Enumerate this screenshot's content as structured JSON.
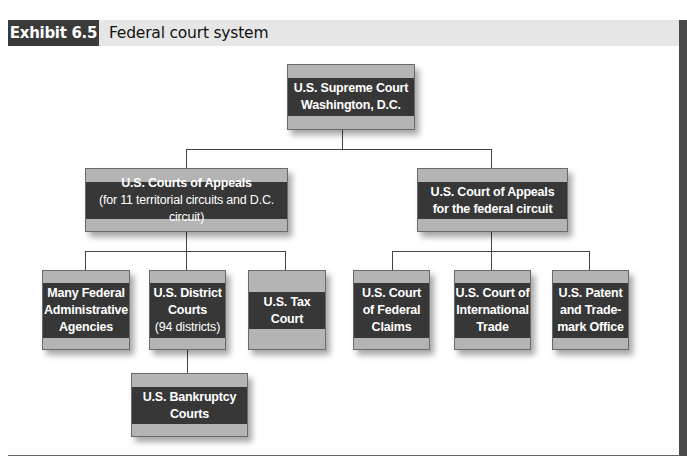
{
  "header": {
    "exhibit_label": "Exhibit 6.5",
    "title": "Federal court system"
  },
  "colors": {
    "box_band": "#b4b4b4",
    "box_dark": "#373737",
    "header_band": "#e6e6e6",
    "header_label": "#3a3a3a"
  },
  "nodes": {
    "supreme": {
      "line1": "U.S. Supreme Court",
      "line2": "Washington, D.C."
    },
    "appeals_circuits": {
      "line1": "U.S. Courts of Appeals",
      "line2": "(for 11 territorial circuits and D.C. circuit)"
    },
    "appeals_federal": {
      "line1": "U.S. Court of Appeals",
      "line2": "for the federal circuit"
    },
    "admin_agencies": {
      "line1": "Many Federal",
      "line2": "Administrative",
      "line3": "Agencies"
    },
    "district": {
      "line1": "U.S. District",
      "line2": "Courts",
      "line3": "(94 districts)"
    },
    "tax": {
      "line1": "U.S. Tax",
      "line2": "Court"
    },
    "federal_claims": {
      "line1": "U.S. Court",
      "line2": "of Federal",
      "line3": "Claims"
    },
    "international_trade": {
      "line1": "U.S. Court of",
      "line2": "International",
      "line3": "Trade"
    },
    "patent": {
      "line1": "U.S. Patent",
      "line2": "and Trade-",
      "line3": "mark Office"
    },
    "bankruptcy": {
      "line1": "U.S. Bankruptcy",
      "line2": "Courts"
    }
  },
  "hierarchy": {
    "supreme": [
      "appeals_circuits",
      "appeals_federal"
    ],
    "appeals_circuits": [
      "admin_agencies",
      "district",
      "tax"
    ],
    "appeals_federal": [
      "federal_claims",
      "international_trade",
      "patent"
    ],
    "district": [
      "bankruptcy"
    ]
  }
}
